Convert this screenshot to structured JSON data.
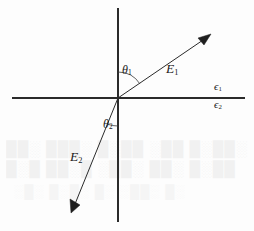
{
  "figure": {
    "type": "vector-diagram",
    "background_color": "#fdfdfd",
    "ink_color": "#1f1f1f",
    "width": 254,
    "height": 231,
    "origin": {
      "x": 118,
      "y": 98
    }
  },
  "axes": {
    "horizontal": {
      "name": "interface-line",
      "x_start": 12,
      "x_end": 245,
      "y": 98
    },
    "vertical": {
      "name": "normal-line",
      "x": 118,
      "y_start": 8,
      "y_end": 222
    }
  },
  "vectors": [
    {
      "id": "E1",
      "label": "E",
      "subscript": "1",
      "from": {
        "x": 118,
        "y": 98
      },
      "to": {
        "x": 211,
        "y": 34
      },
      "angle_from_normal_deg": 56,
      "label_position": {
        "x": 166,
        "y": 62
      }
    },
    {
      "id": "E2",
      "label": "E",
      "subscript": "2",
      "from": {
        "x": 118,
        "y": 98
      },
      "to": {
        "x": 71,
        "y": 213
      },
      "angle_from_normal_deg": 22,
      "label_position": {
        "x": 70,
        "y": 150
      }
    }
  ],
  "angles": [
    {
      "id": "theta1",
      "label": "θ",
      "subscript": "1",
      "arc_radius": 26,
      "label_position": {
        "x": 122,
        "y": 64
      }
    },
    {
      "id": "theta2",
      "label": "θ",
      "subscript": "2",
      "arc_radius": 28,
      "label_position": {
        "x": 103,
        "y": 118
      }
    }
  ],
  "media_labels": [
    {
      "id": "epsilon1",
      "label": "ϵ",
      "subscript": "1",
      "position": {
        "x": 214,
        "y": 81
      },
      "region": "above-interface"
    },
    {
      "id": "epsilon2",
      "label": "ϵ",
      "subscript": "2",
      "position": {
        "x": 214,
        "y": 99
      },
      "region": "below-interface"
    }
  ],
  "scan_artifacts": {
    "present": true,
    "rows": [
      "██░ ███░ █░██ ░██ █░██░",
      "█░█ ██░█ ░██░ ██░ █░██",
      "░█░ █░█░ █░ ░██░ █░"
    ]
  }
}
